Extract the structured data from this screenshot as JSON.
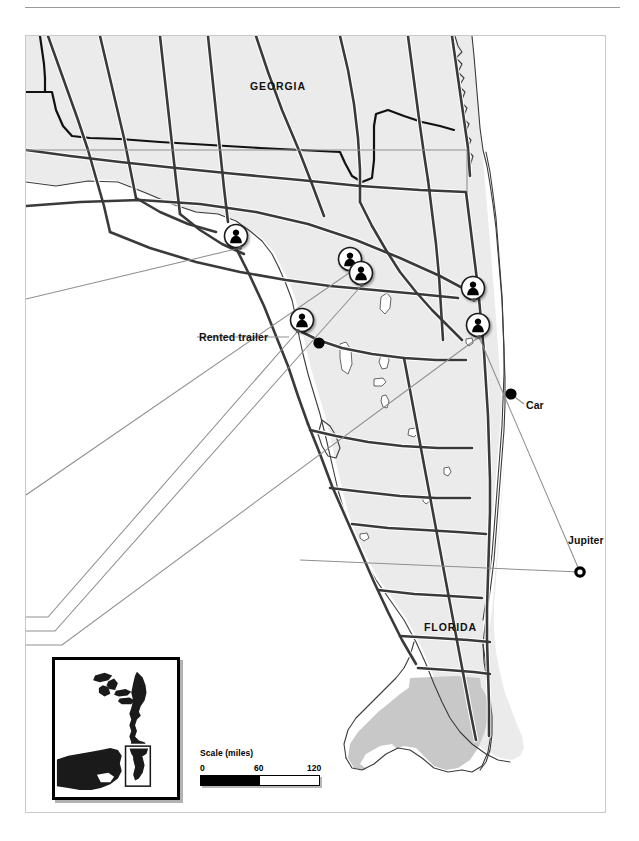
{
  "figure": {
    "type": "locator-map",
    "region": "Florida and southern Georgia, USA",
    "background_color": "#ffffff",
    "land_fill": "#ebebeb",
    "water_fill": "#ffffff",
    "everglades_fill": "#c8c8c8",
    "road_color": "#3a3a3a",
    "border_color": "#111111",
    "marker_color": "#000000",
    "leader_color": "#8f8f8f"
  },
  "state_labels": [
    {
      "id": "georgia",
      "text": "GEORGIA",
      "x": 250,
      "y": 80
    },
    {
      "id": "florida",
      "text": "FLORIDA",
      "x": 424,
      "y": 621
    }
  ],
  "place_labels": [
    {
      "id": "rented-trailer",
      "text": "Rented trailer",
      "x": 199,
      "y": 337,
      "anchor": "start"
    },
    {
      "id": "car",
      "text": "Car",
      "x": 526,
      "y": 403,
      "anchor": "start"
    },
    {
      "id": "jupiter",
      "text": "Jupiter",
      "x": 568,
      "y": 538,
      "anchor": "start"
    }
  ],
  "person_markers": [
    {
      "id": "marker-1",
      "x": 236,
      "y": 236,
      "site_x": 240,
      "site_y": 248
    },
    {
      "id": "marker-2",
      "x": 350,
      "y": 259,
      "site_x": 352,
      "site_y": 271
    },
    {
      "id": "marker-3",
      "x": 361,
      "y": 273,
      "site_x": 362,
      "site_y": 285
    },
    {
      "id": "marker-4",
      "x": 473,
      "y": 288,
      "site_x": 474,
      "site_y": 300
    },
    {
      "id": "marker-5",
      "x": 478,
      "y": 325,
      "site_x": 479,
      "site_y": 337
    },
    {
      "id": "marker-6",
      "x": 302,
      "y": 320,
      "site_x": 298,
      "site_y": 331
    }
  ],
  "dot_markers": [
    {
      "id": "dot-trailer",
      "x": 319,
      "y": 343,
      "r": 5.5,
      "style": "filled"
    },
    {
      "id": "dot-car",
      "x": 511,
      "y": 394,
      "r": 5.5,
      "style": "filled"
    },
    {
      "id": "dot-jupiter",
      "x": 580,
      "y": 572,
      "r": 5.5,
      "style": "ring"
    }
  ],
  "scale": {
    "title": "Scale (miles)",
    "ticks": [
      "0",
      "60",
      "120"
    ],
    "units": "miles",
    "max": 120,
    "x": 200,
    "y": 753
  },
  "inset": {
    "id": "locator-inset",
    "description": "Eastern United States locator with Florida highlighted",
    "highlight_box": true
  },
  "leader_lines": [
    {
      "id": "leader-a",
      "points": "0,150 467,150 467,190"
    },
    {
      "id": "leader-b",
      "points": "0,299 240,248"
    },
    {
      "id": "leader-c",
      "points": "0,495 352,271"
    },
    {
      "id": "leader-d",
      "points": "0,617 48,617 298,331"
    },
    {
      "id": "leader-e",
      "points": "0,631 55,631 362,285"
    },
    {
      "id": "leader-f",
      "points": "0,645 62,645 479,337"
    },
    {
      "id": "leader-g",
      "points": "289,337 197,337"
    },
    {
      "id": "leader-h",
      "points": "479,337 580,572"
    },
    {
      "id": "leader-i",
      "points": "511,394 524,405"
    },
    {
      "id": "leader-j",
      "points": "300,560 580,572"
    }
  ]
}
